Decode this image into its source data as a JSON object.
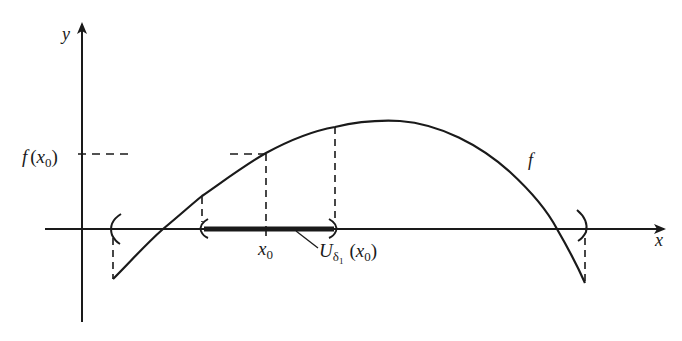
{
  "diagram": {
    "type": "function-neighborhood-plot",
    "axes": {
      "x_label": "x",
      "y_label": "y"
    },
    "curve_label": "f",
    "y_tick_label": {
      "main": "f",
      "open": "(",
      "var": "x",
      "sub": "0",
      "close": ")"
    },
    "x_tick_label": {
      "var": "x",
      "sub": "0"
    },
    "neighborhood_label": {
      "main": "U",
      "sub_greek": "δ",
      "sub_index": "1",
      "open": "(",
      "var": "x",
      "var_sub": "0",
      "close": ")"
    },
    "colors": {
      "ink": "#1a1a1a",
      "background": "#ffffff"
    }
  }
}
